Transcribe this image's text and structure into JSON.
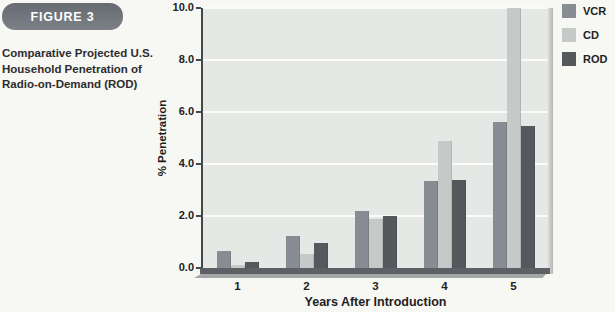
{
  "figure": {
    "label": "FIGURE 3",
    "caption_lines": [
      "Comparative Projected U.S.",
      "Household Penetration of",
      "Radio-on-Demand (ROD)"
    ]
  },
  "chart_data": {
    "type": "bar",
    "title": "",
    "categories": [
      "1",
      "2",
      "3",
      "4",
      "5"
    ],
    "series": [
      {
        "name": "VCR",
        "color": "#878d92",
        "values": [
          0.65,
          1.25,
          2.2,
          3.35,
          5.6
        ]
      },
      {
        "name": "CD",
        "color": "#c5c9c8",
        "values": [
          0.1,
          0.55,
          1.9,
          4.9,
          10.0
        ]
      },
      {
        "name": "ROD",
        "color": "#55595d",
        "values": [
          0.25,
          0.95,
          2.0,
          3.4,
          5.45
        ]
      }
    ],
    "xlabel": "Years After Introduction",
    "ylabel": "% Penetration",
    "ylim": [
      0,
      10
    ],
    "yticks": [
      0,
      2,
      4,
      6,
      8,
      10
    ],
    "ytick_labels": [
      "0.0",
      "2.0",
      "4.0",
      "6.0",
      "8.0",
      "10.0"
    ],
    "grid": true,
    "legend_position": "top-right"
  },
  "colors": {
    "page_bg": "#f7f7f4",
    "plot_bg": "#e6e8e6",
    "gridline": "#fbfbf9",
    "axis": "#44484c",
    "baseline_band": "#5d6165",
    "figure_box": "#6e7379",
    "text": "#222222"
  }
}
